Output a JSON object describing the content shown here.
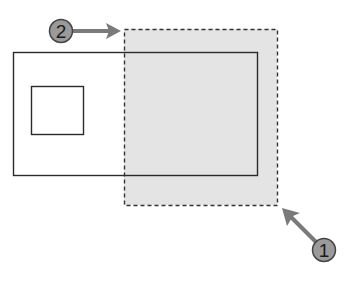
{
  "diagram": {
    "colors": {
      "background": "#ffffff",
      "outline": "#2a2a2a",
      "selection_fill": "#e4e4e4",
      "selection_border": "#333333",
      "callout_fill": "#9a9a9a",
      "callout_border": "#444444",
      "arrow": "#7a7a7a"
    },
    "callouts": [
      {
        "label": "1",
        "description": "first pick point (lower right corner)"
      },
      {
        "label": "2",
        "description": "second pick point (upper left corner)"
      }
    ],
    "shapes": [
      {
        "name": "outer-rectangle"
      },
      {
        "name": "inner-rectangle"
      },
      {
        "name": "selection-window",
        "style": "dashed"
      }
    ]
  }
}
